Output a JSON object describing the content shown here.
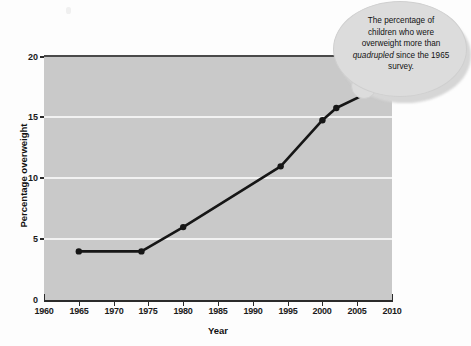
{
  "chart_data": {
    "type": "line",
    "title": "",
    "xlabel": "Year",
    "ylabel": "Percentage overweight",
    "xlim": [
      1960,
      2010
    ],
    "ylim": [
      0,
      20
    ],
    "xticks": [
      1960,
      1965,
      1970,
      1975,
      1980,
      1985,
      1990,
      1995,
      2000,
      2005,
      2010
    ],
    "yticks": [
      0,
      5,
      10,
      15,
      20
    ],
    "grid": "horizontal-white-gridlines-at-5-10-15",
    "legend": "none",
    "series": [
      {
        "name": "Percentage of children overweight",
        "x": [
          1965,
          1974,
          1980,
          1994,
          2000,
          2002,
          2006
        ],
        "values": [
          4.0,
          4.0,
          6.0,
          11.0,
          14.8,
          15.8,
          16.9
        ],
        "marker": "filled-circle",
        "color": "#161616"
      }
    ],
    "annotations": [
      {
        "name": "callout-bubble",
        "lines": [
          "The percentage of",
          "children who were",
          "overweight more than",
          "quadrupled since the 1965",
          "survey."
        ],
        "emphasis_word": "quadrupled",
        "emphasis_style": "italic",
        "points_to_year": 2006
      }
    ]
  },
  "axes": {
    "x_title": "Year",
    "y_title": "Percentage overweight",
    "x_tick_labels": [
      "1960",
      "1965",
      "1970",
      "1975",
      "1980",
      "1985",
      "1990",
      "1995",
      "2000",
      "2005",
      "2010"
    ],
    "y_tick_labels": [
      "0",
      "5",
      "10",
      "15",
      "20"
    ]
  },
  "callout": {
    "line1": "The percentage of",
    "line2": "children who were",
    "line3": "overweight more than",
    "line4_italic": "quadrupled",
    "line4_rest": " since the 1965",
    "line5": "survey."
  },
  "colors": {
    "plot_background": "#c9c9c9",
    "gridline": "#f2f2f2",
    "series_line": "#161616",
    "axis": "#2b2b2b",
    "callout_fill": "#dcdcdc",
    "page_background": "#fdfdfd"
  }
}
